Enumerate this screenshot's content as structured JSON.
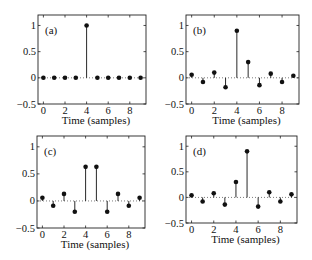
{
  "chart_data": [
    {
      "type": "stem",
      "panel_label": "(a)",
      "xlabel": "Time (samples)",
      "ylabel": "",
      "xlim": [
        -0.5,
        9.5
      ],
      "ylim": [
        -0.5,
        1.2
      ],
      "xticks": [
        0,
        2,
        4,
        6,
        8
      ],
      "yticks": [
        -0.5,
        0,
        0.5,
        1
      ],
      "ytick_labels": [
        "-0.5",
        "0",
        "0.5",
        "1"
      ],
      "x": [
        0,
        1,
        2,
        3,
        4,
        5,
        6,
        7,
        8,
        9
      ],
      "values": [
        0,
        0,
        0,
        0,
        1,
        0,
        0,
        0,
        0,
        0
      ],
      "zero_line": "dotted",
      "grid": false
    },
    {
      "type": "stem",
      "panel_label": "(b)",
      "xlabel": "Time (samples)",
      "ylabel": "",
      "xlim": [
        -0.5,
        9.5
      ],
      "ylim": [
        -0.5,
        1.2
      ],
      "xticks": [
        0,
        2,
        4,
        6,
        8
      ],
      "yticks": [
        -0.5,
        0,
        0.5,
        1
      ],
      "ytick_labels": [
        "-0.5",
        "0",
        "0.5",
        "1"
      ],
      "x": [
        0,
        1,
        2,
        3,
        4,
        5,
        6,
        7,
        8,
        9
      ],
      "values": [
        0.06,
        -0.08,
        0.1,
        -0.18,
        0.9,
        0.3,
        -0.14,
        0.08,
        -0.08,
        0.04
      ],
      "zero_line": "dotted",
      "grid": false
    },
    {
      "type": "stem",
      "panel_label": "(c)",
      "xlabel": "Time (samples)",
      "ylabel": "",
      "xlim": [
        -0.5,
        9.5
      ],
      "ylim": [
        -0.5,
        1.2
      ],
      "xticks": [
        0,
        2,
        4,
        6,
        8
      ],
      "yticks": [
        -0.5,
        0,
        0.5,
        1
      ],
      "ytick_labels": [
        "-0.5",
        "0",
        "0.5",
        "1"
      ],
      "x": [
        0,
        1,
        2,
        3,
        4,
        5,
        6,
        7,
        8,
        9
      ],
      "values": [
        0.06,
        -0.09,
        0.13,
        -0.2,
        0.63,
        0.63,
        -0.2,
        0.13,
        -0.09,
        0.06
      ],
      "zero_line": "dotted",
      "grid": false
    },
    {
      "type": "stem",
      "panel_label": "(d)",
      "xlabel": "Time (samples)",
      "ylabel": "",
      "xlim": [
        -0.5,
        9.5
      ],
      "ylim": [
        -0.5,
        1.2
      ],
      "xticks": [
        0,
        2,
        4,
        6,
        8
      ],
      "yticks": [
        -0.5,
        0,
        0.5,
        1
      ],
      "ytick_labels": [
        "-0.5",
        "0",
        "0.5",
        "1"
      ],
      "x": [
        0,
        1,
        2,
        3,
        4,
        5,
        6,
        7,
        8,
        9
      ],
      "values": [
        0.04,
        -0.08,
        0.08,
        -0.14,
        0.3,
        0.9,
        -0.18,
        0.1,
        -0.08,
        0.06
      ],
      "zero_line": "dotted",
      "grid": false
    }
  ],
  "layout": {
    "panels": [
      {
        "left": 38,
        "top": 15,
        "right": 146,
        "bottom": 104
      },
      {
        "left": 186,
        "top": 15,
        "right": 299,
        "bottom": 104
      },
      {
        "left": 37,
        "top": 136,
        "right": 145,
        "bottom": 228
      },
      {
        "left": 186,
        "top": 136,
        "right": 297,
        "bottom": 223
      }
    ],
    "colors": {
      "axis": "#222222",
      "stem": "#111111",
      "marker": "#111111",
      "zero_line": "#444444"
    }
  }
}
